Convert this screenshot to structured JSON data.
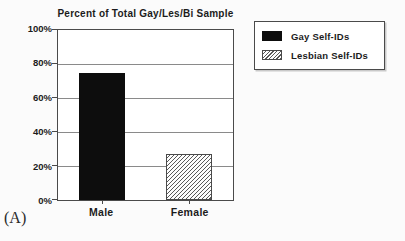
{
  "figure": {
    "label": "(A)"
  },
  "colors": {
    "bar_fill": "#0d0d0d",
    "hatch_line": "#595959",
    "grid_line": "#8a8a8a",
    "axis_line": "#4a4a4a",
    "text": "#1c1c1c",
    "background": "#fbfbfb"
  },
  "chart_data": {
    "type": "bar",
    "title": "Percent of Total Gay/Les/Bi Sample",
    "categories": [
      "Male",
      "Female"
    ],
    "values": [
      75,
      27
    ],
    "ylim": [
      0,
      100
    ],
    "yticks": [
      "100%",
      "80%",
      "60%",
      "40%",
      "20%",
      "0%"
    ],
    "grid": true,
    "legend_position": "top-right",
    "legend": [
      {
        "label": "Gay Self-IDs",
        "fill": "solid-black",
        "category": "Male"
      },
      {
        "label": "Lesbian Self-IDs",
        "fill": "diagonal-hatch",
        "category": "Female"
      }
    ]
  }
}
